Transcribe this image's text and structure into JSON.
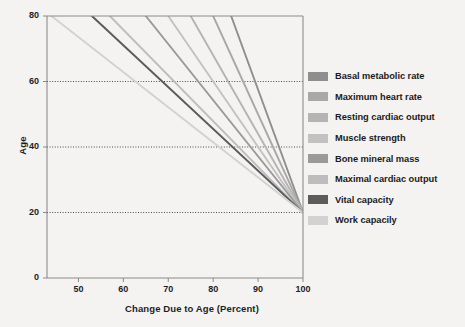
{
  "chart_data": {
    "type": "line",
    "title": "",
    "xlabel": "Change Due to Age (Percent)",
    "ylabel": "Age",
    "xlim": [
      43,
      100
    ],
    "ylim": [
      0,
      80
    ],
    "xticks": [
      50,
      60,
      70,
      80,
      90,
      100
    ],
    "yticks": [
      0,
      20,
      40,
      60,
      80
    ],
    "grid": "horizontal-dotted at 20, 40, 60",
    "legend_position": "right",
    "note": "All series converge at (100 percent, age 20) and decline with increasing age; value at age 80 is the percent remaining.",
    "series": [
      {
        "name": "Basal metabolic rate",
        "color": "#8e8e8e",
        "x": [
          100,
          84
        ],
        "y": [
          20,
          80
        ],
        "value_at_age_80": 84
      },
      {
        "name": "Maximum heart rate",
        "color": "#a8a8a8",
        "x": [
          100,
          80
        ],
        "y": [
          20,
          80
        ],
        "value_at_age_80": 80
      },
      {
        "name": "Resting cardiac output",
        "color": "#b4b4b4",
        "x": [
          100,
          75
        ],
        "y": [
          20,
          80
        ],
        "value_at_age_80": 75
      },
      {
        "name": "Muscle strength",
        "color": "#c2c2c2",
        "x": [
          100,
          70
        ],
        "y": [
          20,
          80
        ],
        "value_at_age_80": 70
      },
      {
        "name": "Bone mineral mass",
        "color": "#9a9a9a",
        "x": [
          100,
          65
        ],
        "y": [
          20,
          80
        ],
        "value_at_age_80": 65
      },
      {
        "name": "Maximal cardiac output",
        "color": "#bdbdbd",
        "x": [
          100,
          57
        ],
        "y": [
          20,
          80
        ],
        "value_at_age_80": 57
      },
      {
        "name": "Vital capacity",
        "color": "#5c5c5c",
        "x": [
          100,
          53
        ],
        "y": [
          20,
          80
        ],
        "value_at_age_80": 53
      },
      {
        "name": "Work capacily",
        "color": "#d2d2d2",
        "x": [
          100,
          44
        ],
        "y": [
          20,
          80
        ],
        "value_at_age_80": 44
      }
    ]
  },
  "axes": {
    "x_title": "Change Due to Age (Percent)",
    "y_title": "Age",
    "x_tick_labels": [
      "50",
      "60",
      "70",
      "80",
      "90",
      "100"
    ],
    "y_tick_labels": [
      "0",
      "20",
      "40",
      "60",
      "80"
    ]
  },
  "legend": {
    "items": [
      {
        "label": "Basal metabolic rate",
        "color": "#8e8e8e"
      },
      {
        "label": "Maximum heart rate",
        "color": "#a8a8a8"
      },
      {
        "label": "Resting cardiac output",
        "color": "#b4b4b4"
      },
      {
        "label": "Muscle strength",
        "color": "#c2c2c2"
      },
      {
        "label": "Bone mineral mass",
        "color": "#9a9a9a"
      },
      {
        "label": "Maximal cardiac output",
        "color": "#bdbdbd"
      },
      {
        "label": "Vital capacity",
        "color": "#5c5c5c"
      },
      {
        "label": "Work capacily",
        "color": "#d2d2d2"
      }
    ]
  },
  "style": {
    "background": "#f4f3f1",
    "axis_color": "#8b8b8b",
    "grid_color": "#3a3a3a",
    "text_color": "#1e1e1e"
  }
}
